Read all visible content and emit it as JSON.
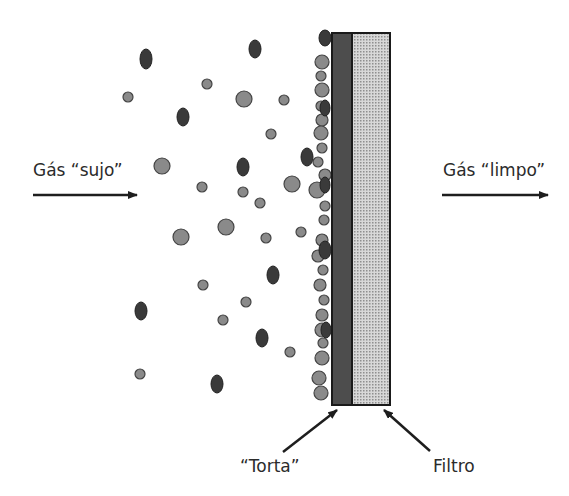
{
  "labels": {
    "dirty_gas": "Gás “sujo”",
    "clean_gas": "Gás “limpo”",
    "cake": "“Torta”",
    "filter": "Filtro"
  },
  "colors": {
    "background": "#ffffff",
    "particle_light_fill": "#8a8a8a",
    "particle_light_stroke": "#444444",
    "particle_dark_fill": "#3a3a3a",
    "cake_layer": "#4d4d4d",
    "filter_medium": "#bdbdbd",
    "text": "#2b2b2b",
    "arrow": "#1e1e1e"
  },
  "filter": {
    "x": 332,
    "y": 33,
    "cake_width": 20,
    "medium_width": 38,
    "height": 372
  },
  "particles_light": [
    [
      128,
      97,
      5
    ],
    [
      207,
      84,
      5
    ],
    [
      244,
      99,
      8
    ],
    [
      284,
      100,
      5
    ],
    [
      271,
      134,
      5
    ],
    [
      162,
      166,
      8
    ],
    [
      202,
      187,
      5
    ],
    [
      243,
      192,
      5
    ],
    [
      260,
      203,
      5
    ],
    [
      292,
      184,
      8
    ],
    [
      181,
      237,
      8
    ],
    [
      226,
      227,
      8
    ],
    [
      266,
      238,
      5
    ],
    [
      301,
      232,
      5
    ],
    [
      203,
      285,
      5
    ],
    [
      246,
      302,
      5
    ],
    [
      223,
      320,
      5
    ],
    [
      290,
      352,
      5
    ],
    [
      140,
      374,
      5
    ],
    [
      322,
      62,
      7
    ],
    [
      321,
      76,
      5
    ],
    [
      322,
      90,
      7
    ],
    [
      321,
      106,
      5
    ],
    [
      322,
      120,
      6
    ],
    [
      321,
      133,
      7
    ],
    [
      322,
      148,
      5
    ],
    [
      318,
      162,
      5
    ],
    [
      325,
      175,
      6
    ],
    [
      317,
      190,
      8
    ],
    [
      325,
      206,
      5
    ],
    [
      324,
      220,
      5
    ],
    [
      322,
      240,
      6
    ],
    [
      318,
      256,
      6
    ],
    [
      323,
      270,
      5
    ],
    [
      320,
      285,
      6
    ],
    [
      324,
      300,
      5
    ],
    [
      322,
      315,
      6
    ],
    [
      322,
      330,
      7
    ],
    [
      323,
      343,
      5
    ],
    [
      322,
      358,
      7
    ],
    [
      319,
      378,
      7
    ],
    [
      321,
      393,
      7
    ]
  ],
  "particles_dark": [
    [
      146,
      59,
      6,
      10
    ],
    [
      255,
      49,
      6,
      9
    ],
    [
      183,
      117,
      6,
      9
    ],
    [
      243,
      167,
      6,
      9
    ],
    [
      141,
      311,
      6,
      9
    ],
    [
      273,
      275,
      6,
      9
    ],
    [
      262,
      338,
      6,
      9
    ],
    [
      217,
      384,
      6,
      9
    ],
    [
      307,
      157,
      6,
      9
    ],
    [
      325,
      38,
      6,
      8
    ],
    [
      325,
      108,
      5,
      8
    ],
    [
      325,
      250,
      6,
      9
    ],
    [
      326,
      330,
      5,
      8
    ],
    [
      325,
      185,
      5,
      8
    ]
  ]
}
